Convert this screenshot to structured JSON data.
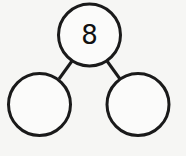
{
  "diagram": {
    "type": "number-bond",
    "whole": {
      "value": "8"
    },
    "parts": [
      {
        "value": ""
      },
      {
        "value": ""
      }
    ]
  },
  "colors": {
    "background": "#f6f6f4",
    "stroke": "#1a1a1a",
    "text": "#111111"
  }
}
